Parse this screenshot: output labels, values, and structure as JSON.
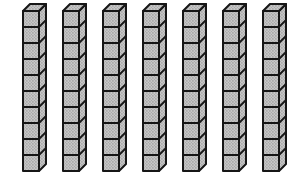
{
  "figure": {
    "type": "base-ten-blocks",
    "rod_count": 7,
    "cubes_per_rod": 10,
    "total_units": 70,
    "colors": {
      "background": "#ffffff",
      "outline": "#161616",
      "face_fill": "#c6c6c6",
      "stipple_dot_dark": "#878787",
      "stipple_dot_mid": "#9d9d9d"
    },
    "layout": {
      "canvas_width": 294,
      "canvas_height": 180,
      "first_rod_x": 23,
      "rod_pitch": 40,
      "cube_size": 16,
      "depth": 7,
      "front_top_y": 11,
      "outline_width": 2,
      "divider_width": 1.8
    }
  }
}
